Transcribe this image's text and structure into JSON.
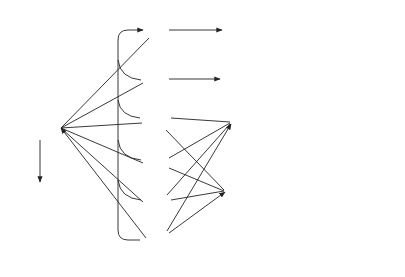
{
  "knowledge_structure": {
    "caption_line1": "Knowledge structure",
    "caption_line2": "for a chair",
    "nodes": {
      "a1": "a1",
      "chair": "chair",
      "x1": "x1",
      "x2": "x2",
      "x3": "x3",
      "x4": "x4",
      "x5": "x5",
      "x6": "x6",
      "seat": "seat",
      "back": "back",
      "leg": "leg",
      "f1": "f1",
      "floor": "floor"
    },
    "edge_labels": {
      "connected_to_1": "connected",
      "connected_to_2": "to",
      "part_of_1": "part",
      "part_of_2": "of",
      "name_a1": "name",
      "name_x6": "name",
      "name_x5": "name",
      "name_x4": "name",
      "name_f1": "name",
      "usually_touches_1": "usually",
      "usually_touches_2": "touches"
    }
  },
  "perception": {
    "axis_y": "y",
    "axis_x": "x",
    "caption_line1": "Stored image from",
    "caption_line2": "a perception"
  }
}
